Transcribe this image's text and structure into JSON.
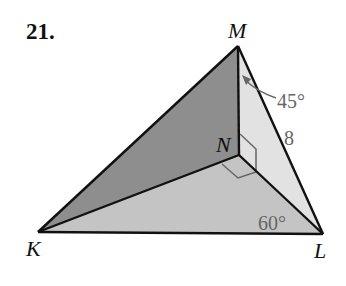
{
  "problem": {
    "number": "21."
  },
  "vertices": {
    "M": {
      "label": "M",
      "x": 238,
      "y": 46
    },
    "N": {
      "label": "N",
      "x": 239,
      "y": 155
    },
    "K": {
      "label": "K",
      "x": 38,
      "y": 232
    },
    "L": {
      "label": "L",
      "x": 323,
      "y": 234
    }
  },
  "measures": {
    "angle_NML": "45°",
    "side_ML": "8",
    "angle_NLK": "60°"
  },
  "colors": {
    "face_KMN": "#8e8e8e",
    "face_MNL": "#e2e2e2",
    "face_KNL": "#c4c4c4",
    "edge": "#111111",
    "annotation": "#666666"
  }
}
